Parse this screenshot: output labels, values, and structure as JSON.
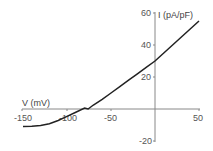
{
  "chart_data": {
    "type": "line",
    "title": "",
    "xlabel": "V (mV)",
    "ylabel": "I (pA/pF)",
    "xlim": [
      -150,
      50
    ],
    "ylim": [
      -20,
      60
    ],
    "xticks": [
      -150,
      -100,
      -50,
      50
    ],
    "yticks": [
      60,
      40,
      20,
      -20
    ],
    "grid": false,
    "legend": null,
    "series": [
      {
        "name": "I-V curve",
        "x": [
          -150,
          -140,
          -130,
          -120,
          -110,
          -100,
          -90,
          -80,
          -76,
          -70,
          -60,
          -50,
          -40,
          -30,
          -20,
          -10,
          0,
          10,
          20,
          30,
          40,
          50
        ],
        "y": [
          -11,
          -10.8,
          -10.3,
          -9.2,
          -7.2,
          -4.6,
          -2,
          0.6,
          0,
          2.5,
          6,
          10,
          14,
          18,
          22,
          26,
          30,
          35,
          40,
          45,
          50,
          55
        ]
      }
    ]
  },
  "axes": {
    "x_label": "V (mV)",
    "y_label": "I (pA/pF)",
    "x_tick_labels": [
      "-150",
      "-100",
      "-50",
      "50"
    ],
    "y_tick_labels": [
      "60",
      "40",
      "20",
      "-20"
    ]
  }
}
